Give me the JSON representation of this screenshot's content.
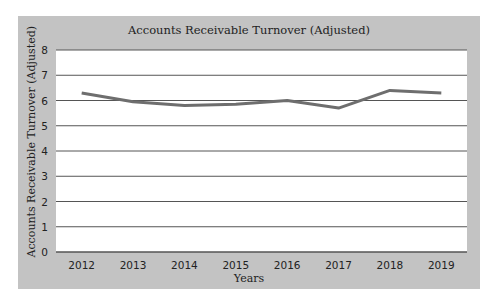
{
  "chart_data": {
    "type": "line",
    "title": "Accounts Receivable Turnover (Adjusted)",
    "xlabel": "Years",
    "ylabel": "Accounts Receivable Turnover (Adjusted)",
    "categories": [
      "2012",
      "2013",
      "2014",
      "2015",
      "2016",
      "2017",
      "2018",
      "2019"
    ],
    "series": [
      {
        "name": "Accounts Receivable Turnover (Adjusted)",
        "values": [
          6.3,
          5.95,
          5.8,
          5.85,
          6.0,
          5.7,
          6.4,
          6.3
        ]
      }
    ],
    "ylim": [
      0,
      8
    ],
    "yticks": [
      0,
      1,
      2,
      3,
      4,
      5,
      6,
      7,
      8
    ],
    "grid": true,
    "legend": "none"
  },
  "colors": {
    "panel": "#c3c3c3",
    "plot_bg": "#ffffff",
    "gridline": "#555555",
    "line": "#6e6e6e"
  }
}
